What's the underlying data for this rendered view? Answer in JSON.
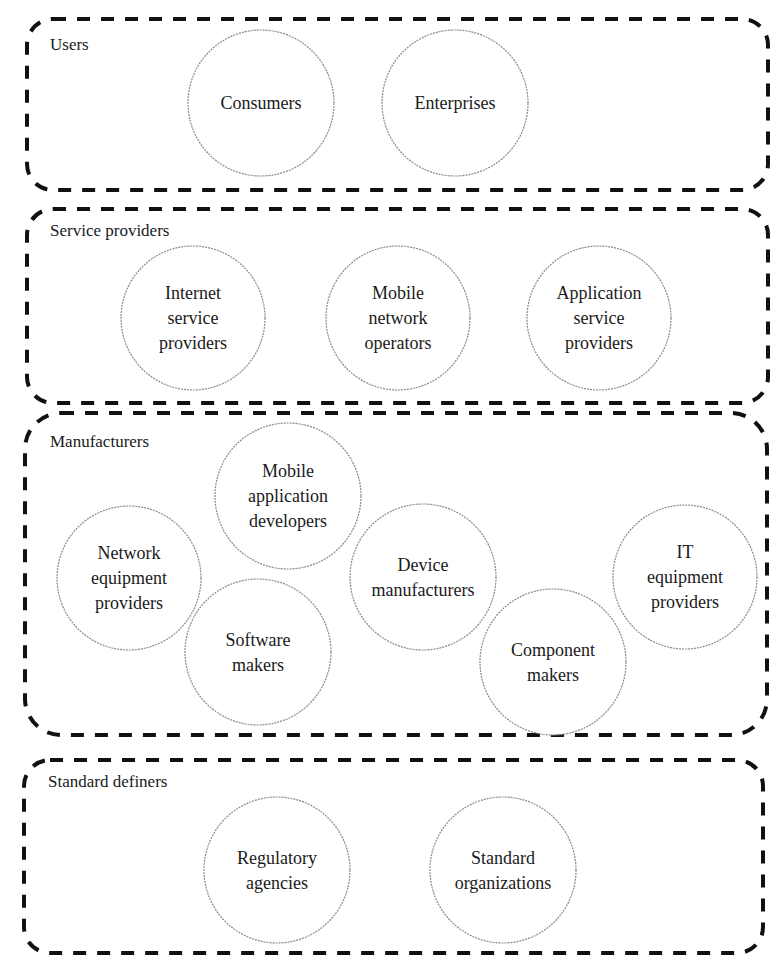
{
  "diagram": {
    "groups": [
      {
        "label": "Users",
        "box": {
          "x": 27,
          "y": 19,
          "w": 741,
          "h": 171,
          "r": 26
        },
        "label_pos": {
          "x": 50,
          "y": 50
        },
        "nodes": [
          {
            "lines": [
              "Consumers"
            ],
            "cx": 261,
            "cy": 103,
            "r": 73
          },
          {
            "lines": [
              "Enterprises"
            ],
            "cx": 455,
            "cy": 103,
            "r": 73
          }
        ]
      },
      {
        "label": "Service providers",
        "box": {
          "x": 27,
          "y": 209,
          "w": 741,
          "h": 194,
          "r": 26
        },
        "label_pos": {
          "x": 50,
          "y": 236
        },
        "nodes": [
          {
            "lines": [
              "Internet",
              "service",
              "providers"
            ],
            "cx": 193,
            "cy": 318,
            "r": 72
          },
          {
            "lines": [
              "Mobile",
              "network",
              "operators"
            ],
            "cx": 398,
            "cy": 318,
            "r": 72
          },
          {
            "lines": [
              "Application",
              "service",
              "providers"
            ],
            "cx": 599,
            "cy": 318,
            "r": 72
          }
        ]
      },
      {
        "label": "Manufacturers",
        "box": {
          "x": 25,
          "y": 413,
          "w": 742,
          "h": 322,
          "r": 36
        },
        "label_pos": {
          "x": 50,
          "y": 447
        },
        "nodes": [
          {
            "lines": [
              "Mobile",
              "application",
              "developers"
            ],
            "cx": 288,
            "cy": 496,
            "r": 73
          },
          {
            "lines": [
              "Network",
              "equipment",
              "providers"
            ],
            "cx": 129,
            "cy": 578,
            "r": 72
          },
          {
            "lines": [
              "Device",
              "manufacturers"
            ],
            "cx": 423,
            "cy": 577,
            "r": 73
          },
          {
            "lines": [
              "IT",
              "equipment",
              "providers"
            ],
            "cx": 685,
            "cy": 577,
            "r": 72
          },
          {
            "lines": [
              "Software",
              "makers"
            ],
            "cx": 258,
            "cy": 652,
            "r": 73
          },
          {
            "lines": [
              "Component",
              "makers"
            ],
            "cx": 553,
            "cy": 662,
            "r": 73
          }
        ]
      },
      {
        "label": "Standard definers",
        "box": {
          "x": 24,
          "y": 760,
          "w": 739,
          "h": 193,
          "r": 26
        },
        "label_pos": {
          "x": 48,
          "y": 787
        },
        "nodes": [
          {
            "lines": [
              "Regulatory",
              "agencies"
            ],
            "cx": 277,
            "cy": 870,
            "r": 73
          },
          {
            "lines": [
              "Standard",
              "organizations"
            ],
            "cx": 503,
            "cy": 870,
            "r": 73
          }
        ]
      }
    ]
  }
}
